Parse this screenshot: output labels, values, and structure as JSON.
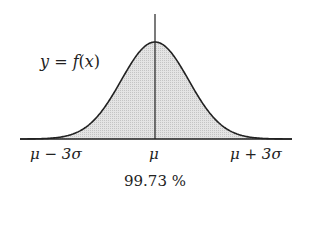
{
  "chart_data": {
    "type": "area",
    "title": "",
    "curve_label": "y = f(x)",
    "x_ticks": [
      "μ − 3σ",
      "μ",
      "μ + 3σ"
    ],
    "shaded_range": [
      "μ − 3σ",
      "μ + 3σ"
    ],
    "shaded_percent": "99.73 %",
    "xlabel": "",
    "ylabel": "",
    "grid": false
  },
  "colors": {
    "curve": "#222222",
    "fill": "#d9d9d9",
    "axis": "#222222"
  }
}
